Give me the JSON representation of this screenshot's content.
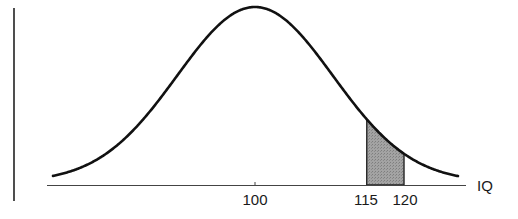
{
  "chart_data": {
    "type": "area",
    "title": "",
    "xlabel": "IQ",
    "ylabel": "",
    "mean": 100,
    "x_ticks": [
      {
        "value": 100,
        "label": "100"
      },
      {
        "value": 115,
        "label": "115"
      },
      {
        "value": 120,
        "label": "120"
      }
    ],
    "shaded_region": {
      "from": 115,
      "to": 120,
      "color": "#9a9a9a"
    },
    "curve_color": "#111111",
    "grid": false
  },
  "labels": {
    "x_axis": "IQ",
    "tick_100": "100",
    "tick_115": "115",
    "tick_120": "120"
  }
}
